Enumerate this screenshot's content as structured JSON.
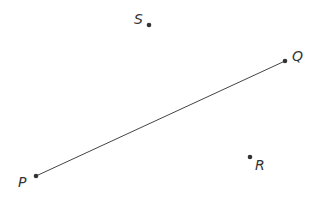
{
  "diagram": {
    "type": "geometry-points",
    "colors": {
      "stroke": "#444444",
      "point": "#333333",
      "text": "#333333",
      "background": "#ffffff"
    },
    "points": [
      {
        "id": "S",
        "label": "S",
        "x": 149,
        "y": 25,
        "lx": 134,
        "ly": 24
      },
      {
        "id": "Q",
        "label": "Q",
        "x": 285,
        "y": 61,
        "lx": 292,
        "ly": 61
      },
      {
        "id": "P",
        "label": "P",
        "x": 36,
        "y": 176,
        "lx": 18,
        "ly": 187
      },
      {
        "id": "R",
        "label": "R",
        "x": 250,
        "y": 157,
        "lx": 255,
        "ly": 170
      }
    ],
    "segments": [
      {
        "from": "P",
        "to": "Q"
      }
    ]
  }
}
